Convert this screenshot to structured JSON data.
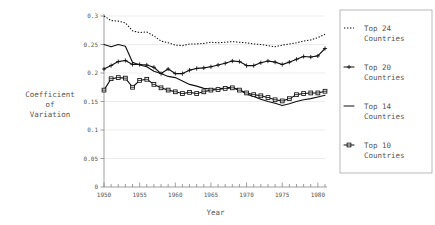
{
  "chart_data": {
    "type": "line",
    "title": "",
    "xlabel": "Year",
    "ylabel": "Coefficient of Variation",
    "ylabel_lines": [
      "Coefficient",
      "of",
      "Variation"
    ],
    "xlim": [
      1950,
      1981
    ],
    "ylim": [
      0,
      0.3
    ],
    "grid": true,
    "legend_position": "right",
    "xticks_major": [
      1950,
      1955,
      1960,
      1965,
      1970,
      1975,
      1980
    ],
    "xticks_minor_step": 1,
    "yticks": [
      0,
      0.05,
      0.1,
      0.15,
      0.2,
      0.25,
      0.3
    ],
    "ytick_labels": [
      "0",
      "0.05",
      "0.1",
      "0.15",
      "0.2",
      "0.25",
      "0.3"
    ],
    "xtick_labels": [
      "1950",
      "1955",
      "1960",
      "1965",
      "1970",
      "1975",
      "1980"
    ],
    "x": [
      1950,
      1951,
      1952,
      1953,
      1954,
      1955,
      1956,
      1957,
      1958,
      1959,
      1960,
      1961,
      1962,
      1963,
      1964,
      1965,
      1966,
      1967,
      1968,
      1969,
      1970,
      1971,
      1972,
      1973,
      1974,
      1975,
      1976,
      1977,
      1978,
      1979,
      1980,
      1981
    ],
    "series": [
      {
        "name": "Top 24 Countries",
        "style": "dotted",
        "marker": "none",
        "color": "#111111",
        "values": [
          0.3,
          0.292,
          0.291,
          0.288,
          0.274,
          0.271,
          0.272,
          0.265,
          0.256,
          0.253,
          0.249,
          0.248,
          0.251,
          0.251,
          0.252,
          0.254,
          0.253,
          0.254,
          0.255,
          0.254,
          0.253,
          0.251,
          0.25,
          0.248,
          0.246,
          0.249,
          0.251,
          0.253,
          0.256,
          0.258,
          0.262,
          0.268
        ]
      },
      {
        "name": "Top 20 Countries",
        "style": "solid",
        "marker": "plus",
        "color": "#111111",
        "values": [
          0.207,
          0.213,
          0.22,
          0.222,
          0.215,
          0.215,
          0.214,
          0.21,
          0.199,
          0.207,
          0.199,
          0.199,
          0.205,
          0.208,
          0.209,
          0.211,
          0.214,
          0.217,
          0.221,
          0.22,
          0.213,
          0.213,
          0.218,
          0.221,
          0.219,
          0.215,
          0.219,
          0.224,
          0.229,
          0.228,
          0.23,
          0.243
        ]
      },
      {
        "name": "Top 14 Countries",
        "style": "solid",
        "marker": "none",
        "color": "#111111",
        "values": [
          0.25,
          0.246,
          0.25,
          0.247,
          0.219,
          0.214,
          0.211,
          0.203,
          0.199,
          0.194,
          0.192,
          0.186,
          0.18,
          0.177,
          0.173,
          0.172,
          0.172,
          0.174,
          0.175,
          0.17,
          0.163,
          0.159,
          0.154,
          0.15,
          0.147,
          0.143,
          0.146,
          0.15,
          0.153,
          0.155,
          0.158,
          0.161
        ]
      },
      {
        "name": "Top 10 Countries",
        "style": "solid",
        "marker": "square",
        "color": "#111111",
        "values": [
          0.17,
          0.19,
          0.192,
          0.191,
          0.175,
          0.187,
          0.189,
          0.18,
          0.174,
          0.17,
          0.167,
          0.164,
          0.166,
          0.164,
          0.167,
          0.17,
          0.171,
          0.173,
          0.174,
          0.17,
          0.165,
          0.162,
          0.16,
          0.157,
          0.153,
          0.151,
          0.155,
          0.162,
          0.164,
          0.165,
          0.165,
          0.168
        ]
      }
    ]
  },
  "legend": {
    "entries": [
      {
        "line1": "Top 24",
        "line2": "Countries",
        "glyph": "dotted"
      },
      {
        "line1": "Top 20",
        "line2": "Countries",
        "glyph": "plus"
      },
      {
        "line1": "Top 14",
        "line2": "Countries",
        "glyph": "solid"
      },
      {
        "line1": "Top 10",
        "line2": "Countries",
        "glyph": "square"
      }
    ]
  }
}
